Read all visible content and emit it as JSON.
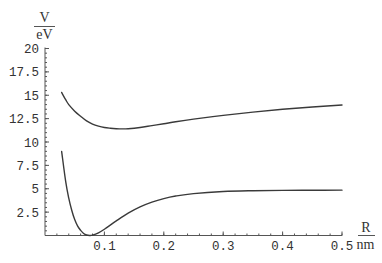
{
  "chart_data": {
    "type": "line",
    "title": "",
    "xlabel": "R / nm",
    "ylabel": "V / eV",
    "xlim": [
      0,
      0.5
    ],
    "ylim": [
      0,
      20
    ],
    "grid": false,
    "legend": null,
    "x_ticks": [
      0.1,
      0.2,
      0.3,
      0.4,
      0.5
    ],
    "x_tick_labels": [
      "0.1",
      "0.2",
      "0.3",
      "0.4",
      "0.5"
    ],
    "y_ticks": [
      2.5,
      5,
      7.5,
      10,
      12.5,
      15,
      17.5,
      20
    ],
    "y_tick_labels": [
      "2.5",
      "5",
      "7.5",
      "10",
      "12.5",
      "15",
      "17.5",
      "20"
    ],
    "x_minor_step": 0.02,
    "y_minor_step": 0.5,
    "series": [
      {
        "name": "upper potential curve",
        "x": [
          0.028,
          0.035,
          0.04,
          0.05,
          0.06,
          0.07,
          0.08,
          0.09,
          0.1,
          0.11,
          0.12,
          0.13,
          0.14,
          0.16,
          0.18,
          0.2,
          0.22,
          0.25,
          0.3,
          0.35,
          0.4,
          0.45,
          0.5
        ],
        "y": [
          15.3,
          14.5,
          14.0,
          13.3,
          12.75,
          12.25,
          11.92,
          11.7,
          11.55,
          11.47,
          11.42,
          11.4,
          11.42,
          11.55,
          11.75,
          11.95,
          12.17,
          12.45,
          12.85,
          13.2,
          13.5,
          13.75,
          13.95
        ]
      },
      {
        "name": "lower potential curve",
        "x": [
          0.028,
          0.035,
          0.04,
          0.045,
          0.05,
          0.055,
          0.06,
          0.065,
          0.07,
          0.075,
          0.08,
          0.09,
          0.1,
          0.12,
          0.14,
          0.16,
          0.18,
          0.2,
          0.22,
          0.25,
          0.3,
          0.35,
          0.4,
          0.45,
          0.5
        ],
        "y": [
          9.0,
          5.7,
          4.0,
          2.7,
          1.7,
          1.0,
          0.55,
          0.22,
          0.05,
          0.0,
          0.04,
          0.29,
          0.67,
          1.56,
          2.39,
          3.06,
          3.57,
          3.95,
          4.22,
          4.48,
          4.7,
          4.79,
          4.83,
          4.84,
          4.85
        ]
      }
    ]
  },
  "axis_labels": {
    "y_numerator": "V",
    "y_denominator": "eV",
    "x_numerator": "R",
    "x_denominator": "nm"
  },
  "style": {
    "curve_color": "#3a3a3a",
    "axis_color": "#555555",
    "background": "#ffffff"
  }
}
